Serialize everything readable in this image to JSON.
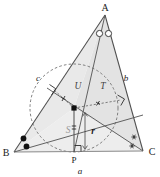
{
  "figure": {
    "type": "geometry-diagram",
    "width": 160,
    "height": 177,
    "background": "#ffffff",
    "stroke_color": "#4a4a4a",
    "dash_color": "#6b6b6b",
    "fill_color": "#e6e6e6",
    "marker_color": "#1a1a1a"
  },
  "vertices": {
    "A": {
      "label": "A",
      "x": 105,
      "y": 15
    },
    "B": {
      "label": "B",
      "x": 14,
      "y": 152
    },
    "C": {
      "label": "C",
      "x": 143,
      "y": 151
    },
    "P": {
      "label": "P",
      "x": 74,
      "y": 152
    },
    "I": {
      "label": "",
      "x": 74,
      "y": 108
    }
  },
  "sides": {
    "a": {
      "label": "a",
      "description": "side BC",
      "x": 80,
      "y": 170
    },
    "b": {
      "label": "b",
      "description": "side AC",
      "x": 126,
      "y": 78
    },
    "c": {
      "label": "c",
      "description": "side AB",
      "x": 38,
      "y": 78
    }
  },
  "regions": {
    "S": {
      "label": "S",
      "description": "triangle BIC",
      "x": 68,
      "y": 130
    },
    "U": {
      "label": "U",
      "description": "triangle AIB",
      "x": 78,
      "y": 86
    },
    "T": {
      "label": "T",
      "description": "triangle AIC",
      "x": 103,
      "y": 86
    }
  },
  "inradius": {
    "label": "r",
    "label_x": 92,
    "label_y": 131,
    "value_px": 44
  },
  "incircle": {
    "center_x": 74,
    "center_y": 108,
    "radius": 44,
    "style": "dashed"
  },
  "angle_markers": {
    "A": {
      "glyph": "open-circle",
      "count": 2,
      "description": "bisected angle at A"
    },
    "B": {
      "glyph": "filled-dot",
      "count": 2,
      "description": "bisected angle at B"
    },
    "C": {
      "glyph": "asterisk",
      "count": 2,
      "description": "bisected angle at C"
    }
  },
  "right_angle_marks": [
    {
      "at": "tangent-point-AB",
      "x": 56,
      "y": 92
    },
    {
      "at": "tangent-point-AC",
      "x": 122,
      "y": 103
    },
    {
      "at": "foot-P-on-BC",
      "x": 78,
      "y": 144
    }
  ],
  "radius_ticks": [
    {
      "along": "I-to-AB",
      "glyph": "tick"
    },
    {
      "along": "I-to-AC",
      "glyph": "tick"
    },
    {
      "along": "I-to-BC",
      "glyph": "tick"
    }
  ]
}
